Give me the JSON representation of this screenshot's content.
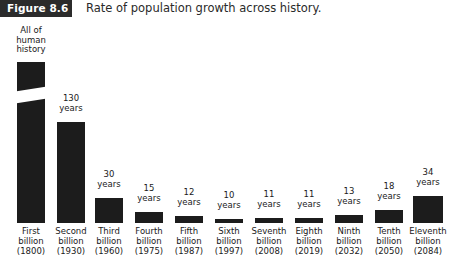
{
  "header": {
    "badge_label": "Figure 8.6",
    "caption": "Rate of population growth across history.",
    "badge_bg": "#2b2b2b",
    "badge_text_color": "#ffffff"
  },
  "chart_data": {
    "type": "bar",
    "title": "Rate of population growth across history.",
    "xlabel": "",
    "ylabel": "",
    "grid": false,
    "legend": null,
    "bar_color": "#1c1c1c",
    "axis_break_on_first_bar": true,
    "note": "First bar is drawn with a diagonal break because 'All of human history' is off-scale relative to the other durations.",
    "categories": [
      "First billion (1800)",
      "Second billion (1930)",
      "Third billion (1960)",
      "Fourth billion (1975)",
      "Fifth billion (1987)",
      "Sixth billion (1997)",
      "Seventh billion (2008)",
      "Eighth billion (2019)",
      "Ninth billion (2032)",
      "Tenth billion (2050)",
      "Eleventh billion (2084)"
    ],
    "values": [
      null,
      130,
      30,
      15,
      12,
      10,
      11,
      11,
      13,
      18,
      34
    ],
    "value_labels": [
      "All of\nhuman\nhistory",
      "130\nyears",
      "30\nyears",
      "15\nyears",
      "12\nyears",
      "10\nyears",
      "11\nyears",
      "11\nyears",
      "13\nyears",
      "18\nyears",
      "34\nyears"
    ],
    "tick_labels": [
      "First\nbillion\n(1800)",
      "Second\nbillion\n(1930)",
      "Third\nbillion\n(1960)",
      "Fourth\nbillion\n(1975)",
      "Fifth\nbillion\n(1987)",
      "Sixth\nbillion\n(1997)",
      "Seventh\nbillion\n(2008)",
      "Eighth\nbillion\n(2019)",
      "Ninth\nbillion\n(2032)",
      "Tenth\nbillion\n(2050)",
      "Eleventh\nbillion\n(2084)"
    ]
  },
  "layout": {
    "bars": [
      {
        "left": 8,
        "width": 46,
        "bar_width": 28,
        "bar_top": 44,
        "value_top": 8,
        "has_break": true,
        "break_top": 71
      },
      {
        "left": 48,
        "width": 46,
        "bar_width": 28,
        "bar_top": 104,
        "value_top": 76,
        "has_break": false,
        "break_top": 0
      },
      {
        "left": 88,
        "width": 42,
        "bar_width": 28,
        "bar_top": 180,
        "value_top": 152,
        "has_break": false,
        "break_top": 0
      },
      {
        "left": 128,
        "width": 42,
        "bar_width": 28,
        "bar_top": 194,
        "value_top": 166,
        "has_break": false,
        "break_top": 0
      },
      {
        "left": 168,
        "width": 42,
        "bar_width": 28,
        "bar_top": 198,
        "value_top": 170,
        "has_break": false,
        "break_top": 0
      },
      {
        "left": 208,
        "width": 42,
        "bar_width": 28,
        "bar_top": 201,
        "value_top": 173,
        "has_break": false,
        "break_top": 0
      },
      {
        "left": 248,
        "width": 42,
        "bar_width": 28,
        "bar_top": 200,
        "value_top": 172,
        "has_break": false,
        "break_top": 0
      },
      {
        "left": 288,
        "width": 42,
        "bar_width": 28,
        "bar_top": 200,
        "value_top": 172,
        "has_break": false,
        "break_top": 0
      },
      {
        "left": 328,
        "width": 42,
        "bar_width": 28,
        "bar_top": 197,
        "value_top": 169,
        "has_break": false,
        "break_top": 0
      },
      {
        "left": 368,
        "width": 42,
        "bar_width": 28,
        "bar_top": 192,
        "value_top": 164,
        "has_break": false,
        "break_top": 0
      },
      {
        "left": 406,
        "width": 44,
        "bar_width": 30,
        "bar_top": 178,
        "value_top": 150,
        "has_break": false,
        "break_top": 0
      }
    ],
    "baseline_y": 205,
    "tick_label_top": 208
  }
}
